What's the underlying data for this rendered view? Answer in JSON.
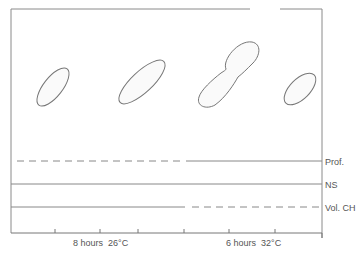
{
  "figure": {
    "cells": [
      {
        "id": "cell-1",
        "shape": "rod",
        "state": "single"
      },
      {
        "id": "cell-2",
        "shape": "rod",
        "state": "elongated"
      },
      {
        "id": "cell-3",
        "shape": "rod",
        "state": "dividing"
      },
      {
        "id": "cell-4",
        "shape": "rod",
        "state": "single"
      }
    ],
    "tracks": [
      {
        "label": "Prof.",
        "pattern": [
          "dashed",
          "solid"
        ]
      },
      {
        "label": "NS",
        "pattern": [
          "solid",
          "solid"
        ]
      },
      {
        "label": "Vol. CH",
        "pattern": [
          "solid",
          "dashed"
        ]
      }
    ],
    "axis": {
      "segments": [
        {
          "label": "8 hours  26°C"
        },
        {
          "label": "6 hours  32°C"
        }
      ]
    },
    "colors": {
      "line": "#777777",
      "dash": "#888888",
      "text": "#555555",
      "frame": "#8a8a8a"
    }
  }
}
